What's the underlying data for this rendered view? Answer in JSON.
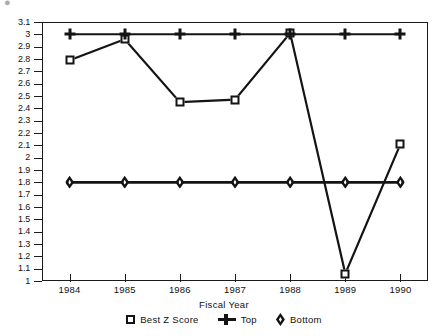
{
  "artifact": {
    "glyph": "●"
  },
  "chart_data": {
    "type": "line",
    "title": "",
    "xlabel": "Fiscal Year",
    "ylabel": "",
    "categories": [
      "1984",
      "1985",
      "1986",
      "1987",
      "1988",
      "1989",
      "1990"
    ],
    "x": [
      1984,
      1985,
      1986,
      1987,
      1988,
      1989,
      1990
    ],
    "xlim": [
      1983.5,
      1990.5
    ],
    "ylim": [
      1,
      3.1
    ],
    "ytick_step": 0.1,
    "ytick_labels": [
      "1",
      "1.1",
      "1.2",
      "1.3",
      "1.4",
      "1.5",
      "1.6",
      "1.7",
      "1.8",
      "1.9",
      "2",
      "2.1",
      "2.2",
      "2.3",
      "2.4",
      "2.5",
      "2.6",
      "2.7",
      "2.8",
      "2.9",
      "3",
      "3.1"
    ],
    "grid": false,
    "legend_position": "bottom",
    "series": [
      {
        "name": "Best Z Score",
        "marker": "square",
        "values": [
          2.79,
          2.96,
          2.45,
          2.47,
          3.01,
          1.06,
          2.11
        ]
      },
      {
        "name": "Top",
        "marker": "plus",
        "values": [
          3.0,
          3.0,
          3.0,
          3.0,
          3.0,
          3.0,
          3.0
        ]
      },
      {
        "name": "Bottom",
        "marker": "diamond",
        "values": [
          1.8,
          1.8,
          1.8,
          1.8,
          1.8,
          1.8,
          1.8
        ]
      }
    ],
    "colors": {
      "line": "#141414",
      "marker_fill": "#ffffff",
      "axis": "#1b1b1b"
    }
  }
}
